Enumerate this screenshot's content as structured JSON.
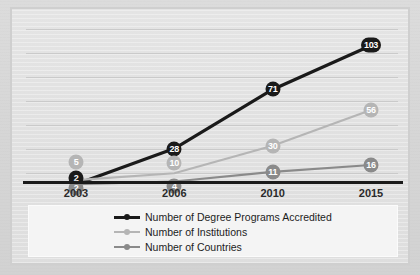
{
  "chart_data": {
    "type": "line",
    "title": "",
    "subtitle": "",
    "xlabel": "",
    "ylabel": "",
    "categories": [
      "2003",
      "2006",
      "2010",
      "2015"
    ],
    "ylim": [
      0,
      115
    ],
    "grid": true,
    "legend_position": "bottom",
    "series": [
      {
        "name": "Number of Degree Programs Accredited",
        "color": "#1a1a1a",
        "values": [
          2,
          28,
          71,
          103
        ],
        "labels": [
          "2",
          "28",
          "71",
          "103"
        ]
      },
      {
        "name": "Number of Institutions",
        "color": "#b5b5b5",
        "values": [
          5,
          10,
          30,
          56
        ],
        "labels": [
          "5",
          "10",
          "30",
          "56"
        ]
      },
      {
        "name": "Number of Countries",
        "color": "#8a8a8a",
        "values": [
          2,
          4,
          11,
          16
        ],
        "labels": [
          "2",
          "4",
          "11",
          "16"
        ]
      }
    ]
  },
  "axis": {
    "ticks": [
      "2003",
      "2006",
      "2010",
      "2015"
    ]
  },
  "legend": {
    "entries": [
      {
        "label": "Number of Degree Programs Accredited",
        "color": "#1a1a1a"
      },
      {
        "label": "Number of Institutions",
        "color": "#b5b5b5"
      },
      {
        "label": "Number of Countries",
        "color": "#8a8a8a"
      }
    ]
  },
  "colors": {
    "series_degree_programs": "#1a1a1a",
    "series_institutions": "#b5b5b5",
    "series_countries": "#8a8a8a",
    "axis": "#1a1a1a",
    "gridline": "#c6c6c6",
    "page_background": "#d9d9d9",
    "chart_background": "#e2e2e2",
    "legend_background": "#f4f4f4"
  }
}
